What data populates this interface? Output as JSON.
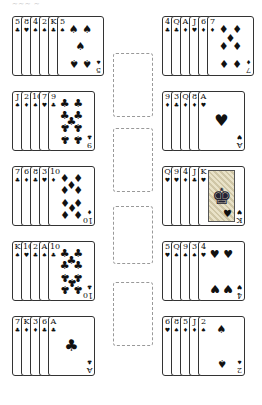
{
  "title": "~~~ ~",
  "suits": {
    "S": "♠",
    "H": "♥",
    "D": "♦",
    "C": "♣"
  },
  "left_rows": [
    {
      "cards": [
        {
          "rank": "5",
          "suit": "C"
        },
        {
          "rank": "8",
          "suit": "H"
        },
        {
          "rank": "4",
          "suit": "S"
        },
        {
          "rank": "2",
          "suit": "S"
        },
        {
          "rank": "K",
          "suit": "C"
        },
        {
          "rank": "5",
          "suit": "S"
        }
      ]
    },
    {
      "cards": [
        {
          "rank": "J",
          "suit": "S"
        },
        {
          "rank": "2",
          "suit": "D"
        },
        {
          "rank": "10",
          "suit": "S"
        },
        {
          "rank": "7",
          "suit": "H"
        },
        {
          "rank": "9",
          "suit": "C"
        }
      ]
    },
    {
      "cards": [
        {
          "rank": "7",
          "suit": "C"
        },
        {
          "rank": "6",
          "suit": "D"
        },
        {
          "rank": "8",
          "suit": "C"
        },
        {
          "rank": "3",
          "suit": "H"
        },
        {
          "rank": "10",
          "suit": "D"
        }
      ]
    },
    {
      "cards": [
        {
          "rank": "K",
          "suit": "S"
        },
        {
          "rank": "10",
          "suit": "H"
        },
        {
          "rank": "2",
          "suit": "C"
        },
        {
          "rank": "A",
          "suit": "S"
        },
        {
          "rank": "10",
          "suit": "C"
        }
      ]
    },
    {
      "cards": [
        {
          "rank": "7",
          "suit": "C"
        },
        {
          "rank": "K",
          "suit": "D"
        },
        {
          "rank": "3",
          "suit": "D"
        },
        {
          "rank": "6",
          "suit": "C"
        },
        {
          "rank": "A",
          "suit": "C"
        }
      ]
    }
  ],
  "right_rows": [
    {
      "cards": [
        {
          "rank": "4",
          "suit": "C"
        },
        {
          "rank": "Q",
          "suit": "C"
        },
        {
          "rank": "A",
          "suit": "D"
        },
        {
          "rank": "J",
          "suit": "H"
        },
        {
          "rank": "6",
          "suit": "D"
        },
        {
          "rank": "7",
          "suit": "D"
        }
      ]
    },
    {
      "cards": [
        {
          "rank": "9",
          "suit": "D"
        },
        {
          "rank": "3",
          "suit": "C"
        },
        {
          "rank": "Q",
          "suit": "D"
        },
        {
          "rank": "8",
          "suit": "D"
        },
        {
          "rank": "A",
          "suit": "H"
        }
      ]
    },
    {
      "cards": [
        {
          "rank": "Q",
          "suit": "H"
        },
        {
          "rank": "9",
          "suit": "H"
        },
        {
          "rank": "4",
          "suit": "D"
        },
        {
          "rank": "J",
          "suit": "C"
        },
        {
          "rank": "K",
          "suit": "H"
        }
      ]
    },
    {
      "cards": [
        {
          "rank": "5",
          "suit": "H"
        },
        {
          "rank": "Q",
          "suit": "S"
        },
        {
          "rank": "9",
          "suit": "S"
        },
        {
          "rank": "3",
          "suit": "S"
        },
        {
          "rank": "4",
          "suit": "H"
        }
      ]
    },
    {
      "cards": [
        {
          "rank": "6",
          "suit": "H"
        },
        {
          "rank": "8",
          "suit": "S"
        },
        {
          "rank": "5",
          "suit": "D"
        },
        {
          "rank": "J",
          "suit": "D"
        },
        {
          "rank": "2",
          "suit": "S"
        }
      ]
    }
  ],
  "foundations": [
    {
      "label": "foundation-1",
      "cards": []
    },
    {
      "label": "foundation-2",
      "cards": []
    },
    {
      "label": "foundation-3",
      "cards": []
    },
    {
      "label": "foundation-4",
      "cards": []
    }
  ]
}
